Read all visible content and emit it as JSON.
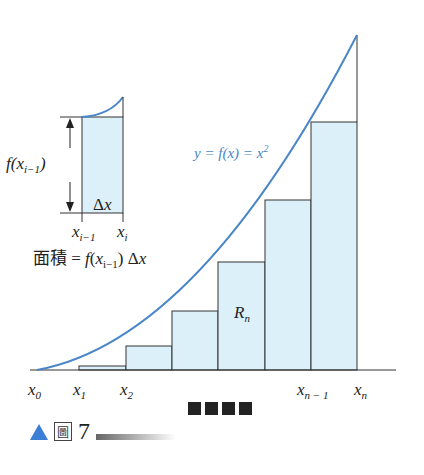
{
  "curve_label": "y = f(x) = x²",
  "rn_label": "Rn",
  "inset": {
    "height_label": "f(x_{i-1})",
    "dx_label": "Δx",
    "left_tick": "x_{i-1}",
    "right_tick": "x_i",
    "area_label": "面積 = f(x_{i-1}) Δx"
  },
  "x_ticks": [
    "x0",
    "x1",
    "x2",
    "xn-1",
    "xn"
  ],
  "caption": {
    "label": "圖",
    "number": "7"
  },
  "colors": {
    "curve": "#4a86c8",
    "fill": "#d9eef8",
    "caption_triangle": "#3a7ed6"
  }
}
